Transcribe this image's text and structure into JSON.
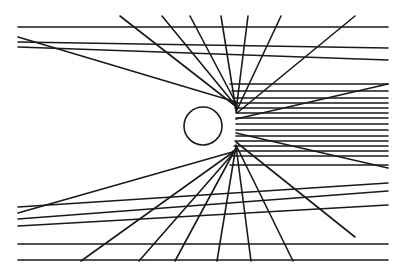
{
  "diagram": {
    "title": "",
    "colors": {
      "background": "#ffffff",
      "stroke": "#1a1a1a"
    },
    "circle": {
      "cx": 203,
      "cy": 126,
      "r": 19
    },
    "lines": [
      {
        "x1": 18,
        "y1": 27,
        "x2": 388,
        "y2": 27
      },
      {
        "x1": 18,
        "y1": 37,
        "x2": 236,
        "y2": 102
      },
      {
        "x1": 18,
        "y1": 42,
        "x2": 388,
        "y2": 48
      },
      {
        "x1": 18,
        "y1": 47,
        "x2": 388,
        "y2": 60
      },
      {
        "x1": 120,
        "y1": 16,
        "x2": 238,
        "y2": 108
      },
      {
        "x1": 162,
        "y1": 16,
        "x2": 236,
        "y2": 106
      },
      {
        "x1": 190,
        "y1": 16,
        "x2": 237,
        "y2": 105
      },
      {
        "x1": 221,
        "y1": 16,
        "x2": 236,
        "y2": 110
      },
      {
        "x1": 248,
        "y1": 16,
        "x2": 236,
        "y2": 111
      },
      {
        "x1": 281,
        "y1": 16,
        "x2": 236,
        "y2": 112
      },
      {
        "x1": 355,
        "y1": 16,
        "x2": 237,
        "y2": 113
      },
      {
        "x1": 388,
        "y1": 84,
        "x2": 236,
        "y2": 119
      },
      {
        "x1": 230,
        "y1": 84,
        "x2": 388,
        "y2": 84
      },
      {
        "x1": 232,
        "y1": 91,
        "x2": 388,
        "y2": 91
      },
      {
        "x1": 233,
        "y1": 98,
        "x2": 388,
        "y2": 98
      },
      {
        "x1": 234,
        "y1": 103,
        "x2": 388,
        "y2": 103
      },
      {
        "x1": 235,
        "y1": 108,
        "x2": 388,
        "y2": 108
      },
      {
        "x1": 236,
        "y1": 113,
        "x2": 388,
        "y2": 113
      },
      {
        "x1": 236,
        "y1": 118,
        "x2": 388,
        "y2": 118
      },
      {
        "x1": 236,
        "y1": 124,
        "x2": 388,
        "y2": 124
      },
      {
        "x1": 236,
        "y1": 130,
        "x2": 388,
        "y2": 130
      },
      {
        "x1": 236,
        "y1": 136,
        "x2": 388,
        "y2": 136
      },
      {
        "x1": 235,
        "y1": 141,
        "x2": 388,
        "y2": 141
      },
      {
        "x1": 234,
        "y1": 146,
        "x2": 388,
        "y2": 146
      },
      {
        "x1": 233,
        "y1": 151,
        "x2": 388,
        "y2": 151
      },
      {
        "x1": 232,
        "y1": 156,
        "x2": 388,
        "y2": 156
      },
      {
        "x1": 230,
        "y1": 165,
        "x2": 388,
        "y2": 165
      },
      {
        "x1": 388,
        "y1": 168,
        "x2": 236,
        "y2": 133
      },
      {
        "x1": 18,
        "y1": 213,
        "x2": 236,
        "y2": 151
      },
      {
        "x1": 18,
        "y1": 207,
        "x2": 388,
        "y2": 183
      },
      {
        "x1": 18,
        "y1": 219,
        "x2": 388,
        "y2": 191
      },
      {
        "x1": 18,
        "y1": 226,
        "x2": 388,
        "y2": 205
      },
      {
        "x1": 18,
        "y1": 244,
        "x2": 388,
        "y2": 244
      },
      {
        "x1": 18,
        "y1": 260,
        "x2": 388,
        "y2": 260
      },
      {
        "x1": 81,
        "y1": 261,
        "x2": 236,
        "y2": 150
      },
      {
        "x1": 139,
        "y1": 261,
        "x2": 237,
        "y2": 149
      },
      {
        "x1": 175,
        "y1": 261,
        "x2": 236,
        "y2": 148
      },
      {
        "x1": 217,
        "y1": 261,
        "x2": 236,
        "y2": 146
      },
      {
        "x1": 251,
        "y1": 261,
        "x2": 236,
        "y2": 146
      },
      {
        "x1": 293,
        "y1": 261,
        "x2": 236,
        "y2": 145
      },
      {
        "x1": 355,
        "y1": 237,
        "x2": 236,
        "y2": 142
      }
    ]
  }
}
